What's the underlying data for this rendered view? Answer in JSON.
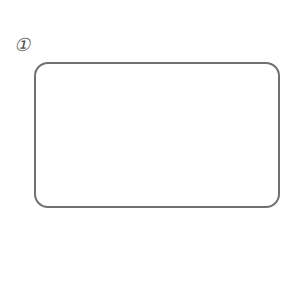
{
  "figure": {
    "label": "①",
    "box": {
      "border_color": "#707070",
      "fill": "#ffffff"
    }
  }
}
